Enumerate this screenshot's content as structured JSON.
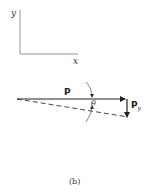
{
  "axes": {
    "x_label": "x",
    "y_label": "y"
  },
  "vectors": {
    "p_label": "P",
    "py_label_main": "P",
    "py_label_sub": "y",
    "angle_label": "θ"
  },
  "caption": "(b)",
  "colors": {
    "line": "#333333",
    "axes": "#777777"
  }
}
